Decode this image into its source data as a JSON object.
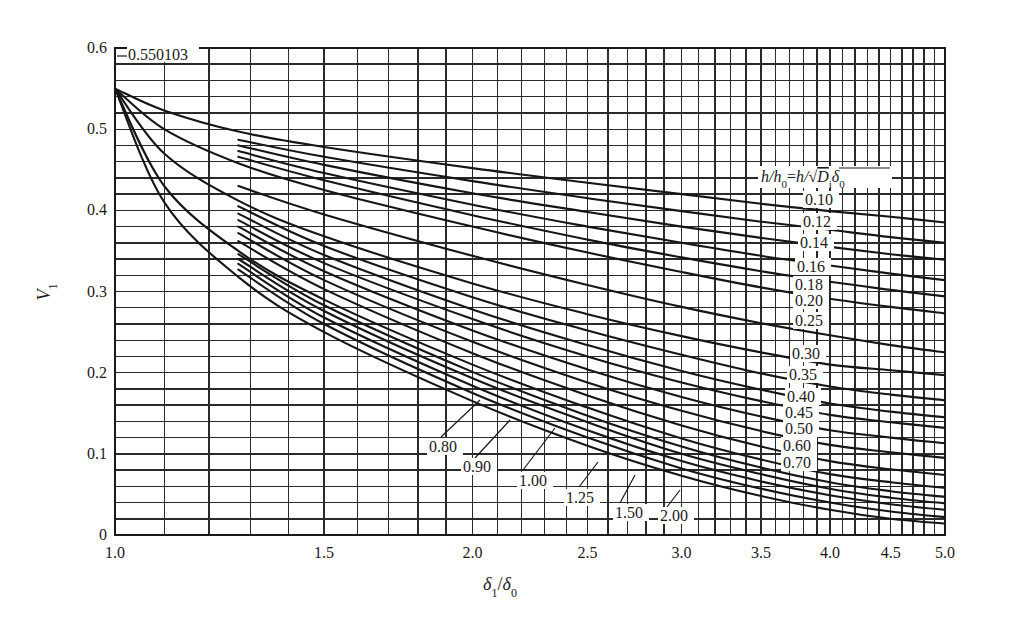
{
  "chart_data": {
    "type": "line",
    "title": "",
    "xlabel": "δ1/δ0",
    "ylabel": "V1",
    "x_scale": "log",
    "xlim": [
      1.0,
      5.0
    ],
    "ylim": [
      0,
      0.6
    ],
    "grid": true,
    "x_ticks": [
      {
        "value": 1.0,
        "label": "1.0"
      },
      {
        "value": 1.5,
        "label": "1.5"
      },
      {
        "value": 2.0,
        "label": "2.0"
      },
      {
        "value": 2.5,
        "label": "2.5"
      },
      {
        "value": 3.0,
        "label": "3.0"
      },
      {
        "value": 3.5,
        "label": "3.5"
      },
      {
        "value": 4.0,
        "label": "4.0"
      },
      {
        "value": 4.5,
        "label": "4.5"
      },
      {
        "value": 5.0,
        "label": "5.0"
      }
    ],
    "y_ticks": [
      {
        "value": 0,
        "label": "0"
      },
      {
        "value": 0.1,
        "label": "0.1"
      },
      {
        "value": 0.2,
        "label": "0.2"
      },
      {
        "value": 0.3,
        "label": "0.3"
      },
      {
        "value": 0.4,
        "label": "0.4"
      },
      {
        "value": 0.5,
        "label": "0.5"
      },
      {
        "value": 0.6,
        "label": "0.6"
      }
    ],
    "x_grid_step": 0.1,
    "y_grid_step": 0.02,
    "origin_annotation": {
      "x": 1.0,
      "y": 0.550103,
      "label": "0.550103"
    },
    "legend_title": "h/h0=h/√(Di δ0)",
    "series": [
      {
        "name": "0.10",
        "x": [
          1.0,
          1.1,
          1.27,
          1.5,
          2.0,
          2.5,
          3.0,
          3.5,
          4.0,
          4.5,
          5.0
        ],
        "y": [
          0.55,
          0.523,
          0.497,
          0.478,
          0.452,
          0.434,
          0.42,
          0.408,
          0.399,
          0.392,
          0.385
        ]
      },
      {
        "name": "0.12",
        "x": [
          1.27,
          1.5,
          2.0,
          2.5,
          3.0,
          3.5,
          4.0,
          4.5,
          5.0
        ],
        "y": [
          0.487,
          0.466,
          0.436,
          0.415,
          0.399,
          0.386,
          0.376,
          0.367,
          0.36
        ]
      },
      {
        "name": "0.14",
        "x": [
          1.27,
          1.5,
          2.0,
          2.5,
          3.0,
          3.5,
          4.0,
          4.5,
          5.0
        ],
        "y": [
          0.48,
          0.456,
          0.421,
          0.398,
          0.38,
          0.366,
          0.355,
          0.346,
          0.339
        ]
      },
      {
        "name": "0.16",
        "x": [
          1.27,
          1.5,
          2.0,
          2.5,
          3.0,
          3.5,
          4.0,
          4.5,
          5.0
        ],
        "y": [
          0.473,
          0.446,
          0.407,
          0.38,
          0.36,
          0.344,
          0.332,
          0.322,
          0.314
        ]
      },
      {
        "name": "0.18",
        "x": [
          1.27,
          1.5,
          2.0,
          2.5,
          3.0,
          3.5,
          4.0,
          4.5,
          5.0
        ],
        "y": [
          0.466,
          0.437,
          0.394,
          0.364,
          0.342,
          0.325,
          0.312,
          0.302,
          0.294
        ]
      },
      {
        "name": "0.20",
        "x": [
          1.0,
          1.1,
          1.27,
          1.5,
          2.0,
          2.5,
          3.0,
          3.5,
          4.0,
          4.5,
          5.0
        ],
        "y": [
          0.55,
          0.5,
          0.458,
          0.425,
          0.38,
          0.348,
          0.324,
          0.305,
          0.291,
          0.281,
          0.273
        ]
      },
      {
        "name": "0.25",
        "x": [
          1.27,
          1.5,
          2.0,
          2.5,
          3.0,
          3.5,
          4.0,
          4.5,
          5.0
        ],
        "y": [
          0.43,
          0.395,
          0.344,
          0.308,
          0.281,
          0.261,
          0.246,
          0.234,
          0.225
        ]
      },
      {
        "name": "0.30",
        "x": [
          1.0,
          1.1,
          1.27,
          1.5,
          2.0,
          2.5,
          3.0,
          3.5,
          4.0,
          4.5,
          5.0
        ],
        "y": [
          0.55,
          0.47,
          0.412,
          0.368,
          0.31,
          0.272,
          0.245,
          0.225,
          0.21,
          0.203,
          0.197
        ]
      },
      {
        "name": "0.35",
        "x": [
          1.27,
          1.5,
          2.0,
          2.5,
          3.0,
          3.5,
          4.0,
          4.5,
          5.0
        ],
        "y": [
          0.405,
          0.356,
          0.293,
          0.252,
          0.222,
          0.199,
          0.183,
          0.173,
          0.166
        ]
      },
      {
        "name": "0.40",
        "x": [
          1.27,
          1.5,
          2.0,
          2.5,
          3.0,
          3.5,
          4.0,
          4.5,
          5.0
        ],
        "y": [
          0.396,
          0.345,
          0.278,
          0.234,
          0.202,
          0.179,
          0.162,
          0.152,
          0.145
        ]
      },
      {
        "name": "0.45",
        "x": [
          1.27,
          1.5,
          2.0,
          2.5,
          3.0,
          3.5,
          4.0,
          4.5,
          5.0
        ],
        "y": [
          0.388,
          0.335,
          0.266,
          0.22,
          0.188,
          0.165,
          0.148,
          0.139,
          0.132
        ]
      },
      {
        "name": "0.50",
        "x": [
          1.27,
          1.5,
          2.0,
          2.5,
          3.0,
          3.5,
          4.0,
          4.5,
          5.0
        ],
        "y": [
          0.38,
          0.325,
          0.252,
          0.204,
          0.17,
          0.146,
          0.129,
          0.12,
          0.113
        ]
      },
      {
        "name": "0.60",
        "x": [
          1.27,
          1.5,
          2.0,
          2.5,
          3.0,
          3.5,
          4.0,
          4.5,
          5.0
        ],
        "y": [
          0.372,
          0.314,
          0.238,
          0.188,
          0.153,
          0.128,
          0.111,
          0.102,
          0.095
        ]
      },
      {
        "name": "0.70",
        "x": [
          1.27,
          1.5,
          2.0,
          2.5,
          3.0,
          3.5,
          4.0,
          4.5,
          5.0
        ],
        "y": [
          0.362,
          0.303,
          0.224,
          0.172,
          0.135,
          0.109,
          0.091,
          0.081,
          0.074
        ]
      },
      {
        "name": "0.80",
        "x": [
          1.0,
          1.1,
          1.27,
          1.5,
          2.0,
          2.5,
          3.0,
          3.5,
          4.0,
          4.5,
          5.0
        ],
        "y": [
          0.55,
          0.43,
          0.35,
          0.29,
          0.21,
          0.157,
          0.119,
          0.093,
          0.075,
          0.065,
          0.058
        ]
      },
      {
        "name": "0.90",
        "x": [
          1.27,
          1.5,
          2.0,
          2.5,
          3.0,
          3.5,
          4.0,
          4.5,
          5.0
        ],
        "y": [
          0.346,
          0.283,
          0.201,
          0.147,
          0.109,
          0.083,
          0.065,
          0.054,
          0.047
        ]
      },
      {
        "name": "1.00",
        "x": [
          1.27,
          1.5,
          2.0,
          2.5,
          3.0,
          3.5,
          4.0,
          4.5,
          5.0
        ],
        "y": [
          0.34,
          0.276,
          0.193,
          0.139,
          0.1,
          0.075,
          0.057,
          0.046,
          0.039
        ]
      },
      {
        "name": "1.25",
        "x": [
          1.27,
          1.5,
          2.0,
          2.5,
          3.0,
          3.5,
          4.0,
          4.5,
          5.0
        ],
        "y": [
          0.334,
          0.268,
          0.184,
          0.129,
          0.091,
          0.066,
          0.049,
          0.038,
          0.031
        ]
      },
      {
        "name": "1.50",
        "x": [
          1.27,
          1.5,
          2.0,
          2.5,
          3.0,
          3.5,
          4.0,
          4.5,
          5.0
        ],
        "y": [
          0.327,
          0.26,
          0.175,
          0.12,
          0.082,
          0.057,
          0.04,
          0.029,
          0.022
        ]
      },
      {
        "name": "2.00",
        "x": [
          1.0,
          1.1,
          1.27,
          1.5,
          2.0,
          2.5,
          3.0,
          3.5,
          4.0,
          4.5,
          5.0
        ],
        "y": [
          0.55,
          0.41,
          0.318,
          0.25,
          0.165,
          0.11,
          0.073,
          0.048,
          0.031,
          0.02,
          0.014
        ]
      }
    ],
    "right_labels": [
      {
        "text": "0.10",
        "x": 805,
        "y": 205
      },
      {
        "text": "0.12",
        "x": 803,
        "y": 227
      },
      {
        "text": "0.14",
        "x": 800,
        "y": 248
      },
      {
        "text": "0.16",
        "x": 797,
        "y": 272
      },
      {
        "text": "0.18",
        "x": 795,
        "y": 290
      },
      {
        "text": "0.20",
        "x": 795,
        "y": 306
      },
      {
        "text": "0.25",
        "x": 795,
        "y": 326
      },
      {
        "text": "0.30",
        "x": 792,
        "y": 359
      },
      {
        "text": "0.35",
        "x": 789,
        "y": 380
      },
      {
        "text": "0.40",
        "x": 787,
        "y": 402
      },
      {
        "text": "0.45",
        "x": 785,
        "y": 418
      },
      {
        "text": "0.50",
        "x": 785,
        "y": 434
      },
      {
        "text": "0.60",
        "x": 783,
        "y": 451
      },
      {
        "text": "0.70",
        "x": 783,
        "y": 468
      }
    ],
    "bottom_labels": [
      {
        "text": "0.80",
        "x": 429,
        "y": 452,
        "lx1": 441,
        "ly1": 437,
        "lx2": 480,
        "ly2": 400
      },
      {
        "text": "0.90",
        "x": 463,
        "y": 472,
        "lx1": 475,
        "ly1": 458,
        "lx2": 510,
        "ly2": 420
      },
      {
        "text": "1.00",
        "x": 519,
        "y": 486,
        "lx1": 523,
        "ly1": 470,
        "lx2": 555,
        "ly2": 428
      },
      {
        "text": "1.25",
        "x": 566,
        "y": 503,
        "lx1": 579,
        "ly1": 487,
        "lx2": 598,
        "ly2": 462
      },
      {
        "text": "1.50",
        "x": 615,
        "y": 518,
        "lx1": 620,
        "ly1": 503,
        "lx2": 635,
        "ly2": 475
      },
      {
        "text": "2.00",
        "x": 660,
        "y": 521,
        "lx1": 667,
        "ly1": 507,
        "lx2": 680,
        "ly2": 490
      }
    ]
  }
}
